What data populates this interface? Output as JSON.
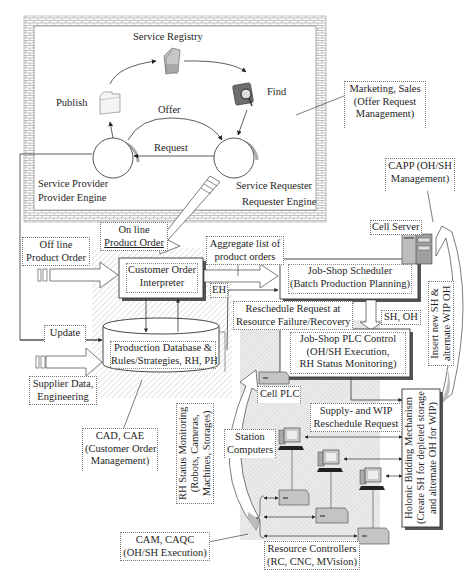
{
  "figure": {
    "type": "system-architecture-diagram",
    "caption": "Fig. 1 Information and data flow of HMES with service-oriented integration"
  },
  "soa_block": {
    "service_registry": "Service Registry",
    "publish": "Publish",
    "find": "Find",
    "offer": "Offer",
    "request": "Request",
    "provider_line1": "Service Provider",
    "provider_line2": "Provider Engine",
    "requester_line1": "Service Requester",
    "requester_line2": "Requester Engine"
  },
  "side_notes": {
    "marketing_line1": "Marketing, Sales",
    "marketing_line2": "(Offer Request",
    "marketing_line3": "Management)",
    "capp_line1": "CAPP (OH/SH",
    "capp_line2": "Management)",
    "cell_server": "Cell Server"
  },
  "inputs": {
    "online_line1": "On line",
    "online_line2": "Product Order",
    "offline_line1": "Off line",
    "offline_line2": "Product Order",
    "update": "Update",
    "supplier_line1": "Supplier Data,",
    "supplier_line2": "Engineering"
  },
  "modules": {
    "coi_line1": "Customer Order",
    "coi_line2": "Interpreter",
    "db_line1": "Production Database &",
    "db_line2": "Rules/Strategies, RH, PH",
    "scheduler_line1": "Job-Shop Scheduler",
    "scheduler_line2": "(Batch Production Planning)",
    "plc_line1": "Job-Shop PLC Control",
    "plc_line2": "(OH/SH Execution,",
    "plc_line3": "RH Status Monitoring)",
    "cell_plc": "Cell PLC"
  },
  "flows": {
    "aggregate_line1": "Aggregate list of",
    "aggregate_line2": "product orders",
    "eh": "EH",
    "reschedule_line1": "Reschedule Request at",
    "reschedule_line2": "Resource Failure/Recovery",
    "sh_oh": "SH, OH",
    "insert_line1": "Insert new SH &",
    "insert_line2": "alternate WIP OH",
    "supply_line1": "Supply- and WIP",
    "supply_line2": "Reschedule Request"
  },
  "shop_floor": {
    "station_line1": "Station",
    "station_line2": "Computers",
    "rh_line1": "RH Status Monitoring",
    "rh_line2": "(Robots, Cameras,",
    "rh_line3": "Machines, Storages)",
    "holonic_line1": "Holonic Bidding Mechanism",
    "holonic_line2": "(Create SH for depleted storage",
    "holonic_line3": "and alternate OH for WIP)",
    "resource_line1": "Resource Controllers",
    "resource_line2": "(RC, CNC, MVision)"
  },
  "cad_notes": {
    "cad_line1": "CAD, CAE",
    "cad_line2": "(Customer Order",
    "cad_line3": "Management)",
    "cam_line1": "CAM, CAQC",
    "cam_line2": "(OH/SH Execution)"
  },
  "colors": {
    "line": "#333333",
    "brick": "#9a9a9a",
    "hatch": "#c9c9c9",
    "shaded_area": "#e6e6e6",
    "device": "#bdbdbd"
  }
}
